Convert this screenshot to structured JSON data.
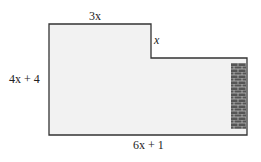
{
  "figure": {
    "labels": {
      "top": "3x",
      "step": "x",
      "left": "4x + 4",
      "bottom": "6x + 1"
    },
    "colors": {
      "fill": "#f2f2f2",
      "stroke": "#333333",
      "brick": "#555555",
      "mortar": "#bbbbbb"
    }
  }
}
